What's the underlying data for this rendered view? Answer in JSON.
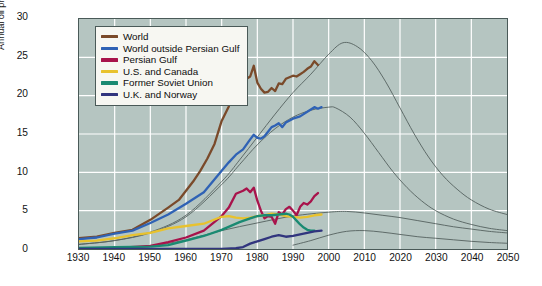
{
  "chart_data": {
    "type": "line",
    "title": "",
    "xlabel": "",
    "ylabel": "Annual oil production (billions of barrels)",
    "xlim": [
      1930,
      2050
    ],
    "ylim": [
      0,
      30
    ],
    "xticks": [
      1930,
      1940,
      1950,
      1960,
      1970,
      1980,
      1990,
      2000,
      2010,
      2020,
      2030,
      2040,
      2050
    ],
    "yticks": [
      0,
      5,
      10,
      15,
      20,
      25,
      30
    ],
    "grid": true,
    "legend_position": "upper-left-inside",
    "background_color": "#b5c5c1",
    "gridline_color": "#ffffff",
    "frame_color": "#4a5a58",
    "projection_color": "#55615f",
    "series": [
      {
        "name": "World",
        "color": "#7a4a2a",
        "x": [
          1930,
          1935,
          1940,
          1945,
          1950,
          1955,
          1958,
          1960,
          1962,
          1964,
          1966,
          1968,
          1970,
          1972,
          1973,
          1974,
          1975,
          1976,
          1977,
          1978,
          1979,
          1980,
          1981,
          1982,
          1983,
          1984,
          1985,
          1986,
          1987,
          1988,
          1989,
          1990,
          1991,
          1992,
          1993,
          1994,
          1995,
          1996,
          1997
        ],
        "values": [
          1.4,
          1.6,
          2.1,
          2.5,
          3.8,
          5.4,
          6.4,
          7.6,
          8.8,
          10.2,
          11.8,
          13.7,
          16.7,
          18.6,
          20.4,
          20.7,
          19.6,
          21.2,
          22.2,
          22.5,
          23.9,
          21.7,
          20.9,
          20.4,
          20.5,
          21.0,
          20.6,
          21.6,
          21.5,
          22.2,
          22.4,
          22.6,
          22.5,
          22.8,
          23.1,
          23.5,
          23.8,
          24.5,
          24.0
        ]
      },
      {
        "name": "World outside Persian Gulf",
        "color": "#2f62b5",
        "x": [
          1930,
          1935,
          1940,
          1945,
          1950,
          1955,
          1960,
          1965,
          1970,
          1972,
          1974,
          1976,
          1978,
          1979,
          1980,
          1981,
          1982,
          1983,
          1984,
          1985,
          1986,
          1987,
          1988,
          1990,
          1992,
          1994,
          1995,
          1996,
          1997,
          1998
        ],
        "values": [
          1.3,
          1.5,
          2.0,
          2.4,
          3.4,
          4.5,
          5.9,
          7.4,
          10.2,
          11.3,
          12.3,
          13.0,
          14.3,
          14.9,
          14.5,
          14.4,
          14.7,
          15.3,
          15.9,
          16.1,
          16.4,
          15.9,
          16.5,
          17.0,
          17.3,
          17.9,
          18.2,
          18.5,
          18.3,
          18.5
        ]
      },
      {
        "name": "Persian Gulf",
        "color": "#a8134b",
        "x": [
          1930,
          1940,
          1950,
          1955,
          1960,
          1965,
          1970,
          1972,
          1974,
          1976,
          1977,
          1978,
          1979,
          1980,
          1981,
          1982,
          1983,
          1984,
          1985,
          1986,
          1987,
          1988,
          1989,
          1990,
          1991,
          1992,
          1993,
          1994,
          1995,
          1996,
          1997
        ],
        "values": [
          0.05,
          0.12,
          0.4,
          0.9,
          1.5,
          2.4,
          4.3,
          5.4,
          7.2,
          7.6,
          7.9,
          7.4,
          8.0,
          6.3,
          5.0,
          4.0,
          4.3,
          4.2,
          3.3,
          4.8,
          4.5,
          5.2,
          5.5,
          5.0,
          4.4,
          5.5,
          6.0,
          5.8,
          6.2,
          6.9,
          7.3
        ]
      },
      {
        "name": "U.S. and Canada",
        "color": "#e8c22e",
        "x": [
          1930,
          1935,
          1940,
          1945,
          1950,
          1955,
          1960,
          1965,
          1970,
          1972,
          1974,
          1976,
          1978,
          1980,
          1982,
          1984,
          1986,
          1988,
          1990,
          1992,
          1994,
          1996,
          1998
        ],
        "values": [
          1.0,
          1.1,
          1.4,
          1.8,
          2.1,
          2.7,
          3.0,
          3.3,
          4.2,
          4.3,
          4.1,
          4.0,
          4.1,
          4.3,
          4.4,
          4.6,
          4.5,
          4.3,
          4.2,
          4.1,
          4.2,
          4.4,
          4.5
        ]
      },
      {
        "name": "Former Soviet Union",
        "color": "#1a8a72",
        "x": [
          1930,
          1940,
          1950,
          1955,
          1960,
          1965,
          1970,
          1975,
          1978,
          1980,
          1982,
          1984,
          1986,
          1988,
          1989,
          1990,
          1991,
          1992,
          1993,
          1994,
          1995,
          1996
        ],
        "values": [
          0.15,
          0.25,
          0.3,
          0.5,
          1.1,
          1.7,
          2.5,
          3.5,
          4.0,
          4.3,
          4.4,
          4.4,
          4.5,
          4.6,
          4.5,
          4.2,
          3.7,
          3.2,
          2.8,
          2.5,
          2.4,
          2.4
        ]
      },
      {
        "name": "U.K. and Norway",
        "color": "#31357e",
        "x": [
          1930,
          1950,
          1965,
          1970,
          1974,
          1976,
          1978,
          1980,
          1982,
          1984,
          1986,
          1987,
          1988,
          1990,
          1992,
          1994,
          1996,
          1998
        ],
        "values": [
          0.0,
          0.0,
          0.0,
          0.02,
          0.1,
          0.25,
          0.7,
          1.0,
          1.3,
          1.6,
          1.8,
          1.7,
          1.6,
          1.7,
          1.9,
          2.1,
          2.3,
          2.4
        ]
      }
    ],
    "projections": [
      {
        "name": "World projection",
        "x": [
          1930,
          1940,
          1950,
          1960,
          1970,
          1975,
          1980,
          1985,
          1990,
          1995,
          2000,
          2004,
          2008,
          2012,
          2016,
          2020,
          2024,
          2028,
          2032,
          2036,
          2040,
          2045,
          2050
        ],
        "values": [
          0.6,
          1.1,
          2.2,
          4.4,
          8.8,
          11.6,
          14.6,
          17.6,
          20.4,
          22.8,
          25.4,
          26.9,
          26.4,
          24.6,
          21.8,
          18.4,
          15.0,
          12.0,
          9.6,
          7.8,
          6.4,
          5.2,
          4.5
        ]
      },
      {
        "name": "World outside Persian Gulf projection",
        "x": [
          1930,
          1940,
          1950,
          1960,
          1970,
          1975,
          1980,
          1985,
          1990,
          1995,
          2000,
          2002,
          2006,
          2010,
          2014,
          2018,
          2022,
          2026,
          2030,
          2035,
          2040,
          2045,
          2050
        ],
        "values": [
          0.6,
          1.1,
          2.1,
          4.2,
          8.4,
          11.0,
          13.6,
          15.7,
          17.2,
          18.1,
          18.5,
          18.4,
          17.2,
          15.1,
          12.6,
          10.1,
          8.0,
          6.3,
          5.0,
          3.9,
          3.2,
          2.7,
          2.4
        ]
      },
      {
        "name": "Persian Gulf projection",
        "x": [
          1950,
          1960,
          1970,
          1980,
          1990,
          2000,
          2005,
          2010,
          2015,
          2020,
          2025,
          2030,
          2035,
          2040,
          2045,
          2050
        ],
        "values": [
          0.3,
          1.2,
          2.4,
          3.4,
          4.3,
          4.8,
          4.9,
          4.7,
          4.4,
          4.1,
          3.7,
          3.3,
          2.9,
          2.6,
          2.3,
          2.1
        ]
      },
      {
        "name": "Lower region projection",
        "x": [
          1990,
          1995,
          2000,
          2005,
          2010,
          2015,
          2020,
          2025,
          2030,
          2035,
          2040,
          2045,
          2050
        ],
        "values": [
          0.5,
          1.1,
          1.8,
          2.3,
          2.4,
          2.2,
          1.9,
          1.6,
          1.4,
          1.2,
          1.0,
          0.85,
          0.75
        ]
      }
    ]
  },
  "legend": {
    "entries": [
      {
        "label": "World",
        "color": "#7a4a2a"
      },
      {
        "label": "World outside Persian Gulf",
        "color": "#2f62b5"
      },
      {
        "label": "Persian Gulf",
        "color": "#a8134b"
      },
      {
        "label": "U.S. and Canada",
        "color": "#e8c22e"
      },
      {
        "label": "Former Soviet Union",
        "color": "#1a8a72"
      },
      {
        "label": "U.K. and Norway",
        "color": "#31357e"
      }
    ]
  }
}
